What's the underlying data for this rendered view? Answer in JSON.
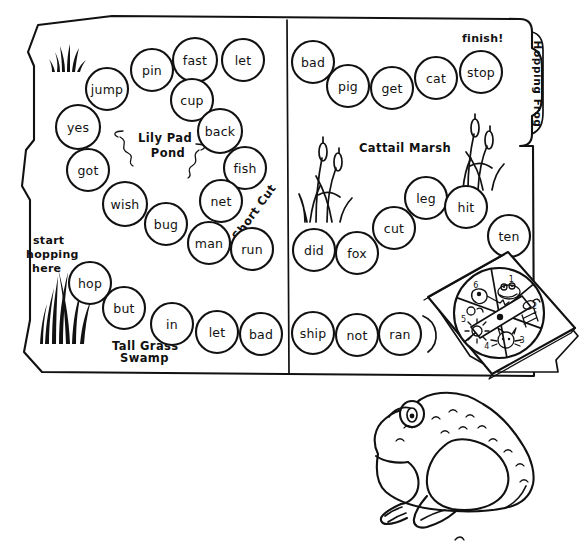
{
  "page": {
    "title": "Hopping Frog",
    "kind": "printable-board-game-worksheet",
    "ink_color": "#111111",
    "paper_color": "#ffffff"
  },
  "board": {
    "tab_label": "Hopping Frog",
    "start_note": "start\nhopping\nhere",
    "start_note_lines": [
      "start",
      "hopping",
      "here"
    ],
    "finish_note": "finish!",
    "shortcut_label": "Short Cut",
    "regions": [
      {
        "name": "lily-pad-pond",
        "label_lines": [
          "Lily Pad",
          "Pond"
        ],
        "label": "Lily Pad Pond"
      },
      {
        "name": "tall-grass-swamp",
        "label_lines": [
          "Tall Grass",
          "Swamp"
        ],
        "label": "Tall Grass Swamp"
      },
      {
        "name": "cattail-marsh",
        "label_lines": [
          "Cattail Marsh"
        ],
        "label": "Cattail Marsh"
      }
    ],
    "left_panel_words": [
      {
        "word": "jump",
        "cx": 107,
        "cy": 89,
        "r": 21
      },
      {
        "word": "pin",
        "cx": 152,
        "cy": 70,
        "r": 21
      },
      {
        "word": "fast",
        "cx": 195,
        "cy": 60,
        "r": 22
      },
      {
        "word": "let",
        "cx": 243,
        "cy": 60,
        "r": 21
      },
      {
        "word": "cup",
        "cx": 192,
        "cy": 100,
        "r": 21
      },
      {
        "word": "yes",
        "cx": 78,
        "cy": 127,
        "r": 22
      },
      {
        "word": "back",
        "cx": 220,
        "cy": 131,
        "r": 22
      },
      {
        "word": "got",
        "cx": 88,
        "cy": 170,
        "r": 21
      },
      {
        "word": "fish",
        "cx": 245,
        "cy": 168,
        "r": 21
      },
      {
        "word": "wish",
        "cx": 125,
        "cy": 204,
        "r": 22
      },
      {
        "word": "net",
        "cx": 221,
        "cy": 201,
        "r": 21
      },
      {
        "word": "bug",
        "cx": 166,
        "cy": 224,
        "r": 21
      },
      {
        "word": "man",
        "cx": 209,
        "cy": 243,
        "r": 21
      },
      {
        "word": "run",
        "cx": 252,
        "cy": 249,
        "r": 21
      },
      {
        "word": "hop",
        "cx": 90,
        "cy": 283,
        "r": 21
      },
      {
        "word": "but",
        "cx": 124,
        "cy": 308,
        "r": 21
      },
      {
        "word": "in",
        "cx": 172,
        "cy": 324,
        "r": 21
      },
      {
        "word": "let",
        "cx": 217,
        "cy": 332,
        "r": 21
      },
      {
        "word": "bad",
        "cx": 261,
        "cy": 334,
        "r": 21
      }
    ],
    "right_panel_words": [
      {
        "word": "bad",
        "cx": 313,
        "cy": 62,
        "r": 21
      },
      {
        "word": "pig",
        "cx": 348,
        "cy": 86,
        "r": 21
      },
      {
        "word": "get",
        "cx": 392,
        "cy": 88,
        "r": 21
      },
      {
        "word": "cat",
        "cx": 436,
        "cy": 78,
        "r": 21
      },
      {
        "word": "stop",
        "cx": 481,
        "cy": 72,
        "r": 21
      },
      {
        "word": "leg",
        "cx": 426,
        "cy": 198,
        "r": 21
      },
      {
        "word": "hit",
        "cx": 466,
        "cy": 207,
        "r": 21
      },
      {
        "word": "cut",
        "cx": 394,
        "cy": 228,
        "r": 21
      },
      {
        "word": "ten",
        "cx": 509,
        "cy": 236,
        "r": 21
      },
      {
        "word": "did",
        "cx": 314,
        "cy": 250,
        "r": 21
      },
      {
        "word": "fox",
        "cx": 357,
        "cy": 253,
        "r": 21
      },
      {
        "word": "ship",
        "cx": 313,
        "cy": 333,
        "r": 21
      },
      {
        "word": "not",
        "cx": 357,
        "cy": 335,
        "r": 21
      },
      {
        "word": "ran",
        "cx": 400,
        "cy": 334,
        "r": 21
      }
    ]
  },
  "spinner": {
    "name": "spinner-card",
    "wedge_count": 6,
    "wedge_numbers": [
      "1",
      "2",
      "3",
      "4",
      "5",
      "6"
    ],
    "wedge_pictures": [
      "frog",
      "fly",
      "sun",
      "cat",
      "bug",
      "key"
    ],
    "has_arrow": true
  },
  "illustration": {
    "frog": {
      "name": "frog-illustration",
      "facing": "left",
      "style": "line-art"
    }
  }
}
